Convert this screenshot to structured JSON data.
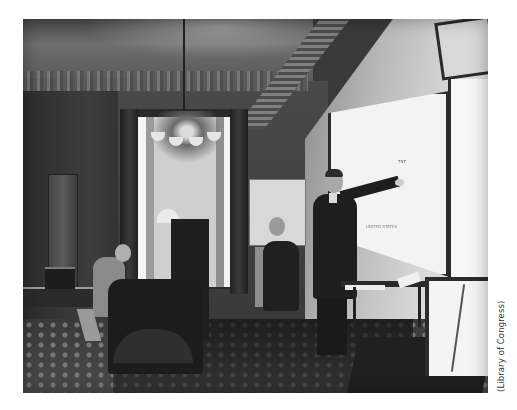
{
  "image": {
    "description": "Historical black-and-white photograph of an ornate office: a standing man in a dark suit points at a large wall map/board while two other men sit at desks; a chandelier hangs in front of a curtained window.",
    "style": "monochrome"
  },
  "board": {
    "label_top": "TNT",
    "label_mid": "UNITED STATES"
  },
  "credit": {
    "text": "(Library of Congress)"
  },
  "colors": {
    "background": "#ffffff",
    "photo_dark": "#1e1e1e",
    "photo_light": "#f3f3f3",
    "credit_text": "#333333"
  }
}
